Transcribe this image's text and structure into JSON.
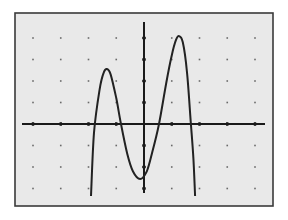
{
  "screen": {
    "frame": {
      "x": 15,
      "y": 13,
      "width": 258,
      "height": 193
    },
    "background": "#e9e9e9",
    "border_color": "#3a3a3a",
    "axis_color": "#1a1a1a",
    "curve_color": "#222222",
    "dot_color": "#6a6a6a"
  },
  "chart_data": {
    "type": "line",
    "title": "",
    "xlabel": "",
    "ylabel": "",
    "style": "graphing-calculator screen",
    "grid": "dots at integer lattice points",
    "origin_px": [
      144,
      124
    ],
    "unit_px": {
      "x": 27.75,
      "y": 21.5
    },
    "xlim": [
      -4.2,
      4.5
    ],
    "ylim": [
      -3.8,
      4.7
    ],
    "x_ticks": [
      -4,
      -3,
      -2,
      -1,
      1,
      2,
      3,
      4
    ],
    "y_ticks": [
      -3,
      -2,
      -1,
      1,
      2,
      3,
      4
    ],
    "series": [
      {
        "name": "quartic curve",
        "description": "Downward-opening quartic with two local maxima and one local minimum",
        "key_points": {
          "local_max_left": [
            -1.33,
            2.56
          ],
          "local_min": [
            -0.14,
            -2.56
          ],
          "local_max_right": [
            1.26,
            4.09
          ],
          "x_intercepts": [
            -1.77,
            -0.83,
            0.54,
            1.69
          ],
          "left_end": [
            -1.91,
            -3.35
          ],
          "right_end": [
            1.84,
            -3.35
          ]
        },
        "x": [
          -1.91,
          -1.8,
          -1.6,
          -1.45,
          -1.33,
          -1.2,
          -1.0,
          -0.83,
          -0.6,
          -0.4,
          -0.14,
          0.1,
          0.3,
          0.54,
          0.8,
          1.0,
          1.15,
          1.26,
          1.4,
          1.55,
          1.69,
          1.78,
          1.84
        ],
        "y": [
          -3.35,
          -0.4,
          1.6,
          2.4,
          2.56,
          2.3,
          1.2,
          0.0,
          -1.4,
          -2.2,
          -2.56,
          -2.2,
          -1.3,
          0.0,
          1.9,
          3.2,
          3.9,
          4.09,
          3.8,
          2.4,
          0.0,
          -1.6,
          -3.35
        ]
      }
    ]
  }
}
